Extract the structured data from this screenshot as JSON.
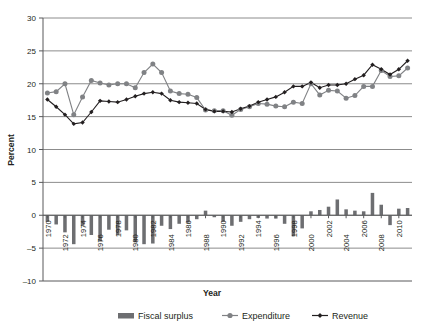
{
  "chart_data": {
    "type": "bar",
    "title": "",
    "xlabel": "Year",
    "ylabel": "Percent",
    "ylim": [
      -10,
      30
    ],
    "ytick_step": 5,
    "yticks": [
      30,
      25,
      20,
      15,
      10,
      5,
      0,
      -5,
      -10
    ],
    "grid": "horizontal",
    "legend_position": "bottom",
    "x": [
      1970,
      1971,
      1972,
      1973,
      1974,
      1975,
      1976,
      1977,
      1978,
      1979,
      1980,
      1981,
      1982,
      1983,
      1984,
      1985,
      1986,
      1987,
      1988,
      1989,
      1990,
      1991,
      1992,
      1993,
      1994,
      1995,
      1996,
      1997,
      1998,
      1999,
      2000,
      2001,
      2002,
      2003,
      2004,
      2005,
      2006,
      2007,
      2008,
      2009,
      2010,
      2011
    ],
    "xtick_labels": [
      "1970",
      "1972",
      "1974",
      "1976",
      "1978",
      "1980",
      "1982",
      "1984",
      "1986",
      "1988",
      "1990",
      "1992",
      "1994",
      "1996",
      "1998",
      "2000",
      "2002",
      "2004",
      "2006",
      "2008",
      "2010"
    ],
    "series": [
      {
        "name": "Fiscal surplus",
        "type": "bar",
        "color": "#6d6e71",
        "values": [
          -1.0,
          -1.4,
          -2.6,
          -4.4,
          -1.6,
          -3.0,
          -4.0,
          -2.2,
          -3.0,
          -2.3,
          -4.1,
          -4.4,
          -4.3,
          -1.6,
          -2.1,
          -1.3,
          -1.1,
          -0.6,
          0.7,
          -0.3,
          -1.0,
          -1.6,
          -1.0,
          -0.6,
          -0.4,
          -0.5,
          -0.5,
          -1.3,
          -3.2,
          -2.0,
          0.6,
          0.8,
          1.3,
          2.4,
          0.9,
          0.7,
          0.6,
          3.4,
          1.6,
          -1.5,
          1.0,
          1.1
        ]
      },
      {
        "name": "Expenditure",
        "type": "line",
        "color": "#808285",
        "marker": "circle",
        "values": [
          18.6,
          18.8,
          20.0,
          15.3,
          18.0,
          20.5,
          20.1,
          19.8,
          20.0,
          20.0,
          19.4,
          21.7,
          23.0,
          21.7,
          18.9,
          18.5,
          18.4,
          17.9,
          16.0,
          15.9,
          15.9,
          15.2,
          16.1,
          16.5,
          17.0,
          16.9,
          16.6,
          16.5,
          17.2,
          17.0,
          20.0,
          18.3,
          19.0,
          18.9,
          17.8,
          18.2,
          19.6,
          19.6,
          22.0,
          21.1,
          21.2,
          22.4
        ]
      },
      {
        "name": "Revenue",
        "type": "line",
        "color": "#231f20",
        "marker": "diamond",
        "values": [
          17.6,
          16.5,
          15.3,
          13.9,
          14.1,
          15.7,
          17.4,
          17.3,
          17.2,
          17.6,
          18.1,
          18.5,
          18.7,
          18.5,
          17.5,
          17.2,
          17.1,
          17.0,
          16.1,
          15.8,
          15.8,
          15.7,
          16.2,
          16.6,
          17.2,
          17.6,
          18.0,
          18.7,
          19.6,
          19.6,
          20.2,
          19.4,
          19.8,
          19.8,
          20.0,
          20.7,
          21.3,
          22.9,
          22.2,
          21.4,
          22.2,
          23.5
        ]
      }
    ],
    "legend": [
      {
        "label": "Fiscal surplus",
        "marker": "bar",
        "color": "#6d6e71"
      },
      {
        "label": "Expenditure",
        "marker": "circle-line",
        "color": "#808285"
      },
      {
        "label": "Revenue",
        "marker": "diamond-line",
        "color": "#231f20"
      }
    ]
  }
}
